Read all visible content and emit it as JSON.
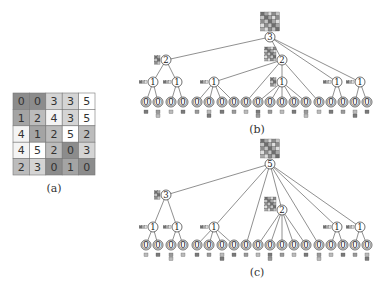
{
  "panel_a": {
    "caption": "(a)",
    "grid": [
      [
        0,
        0,
        3,
        3,
        5
      ],
      [
        1,
        2,
        4,
        3,
        5
      ],
      [
        4,
        1,
        2,
        5,
        2
      ],
      [
        4,
        5,
        2,
        0,
        3
      ],
      [
        2,
        3,
        0,
        1,
        0
      ]
    ],
    "value_colors": {
      "0": "#8c8c8c",
      "1": "#a4a4a4",
      "2": "#bcbcbc",
      "3": "#d4d4d4",
      "4": "#f4f4f4",
      "5": "#ffffff"
    }
  },
  "panel_b": {
    "caption": "(b)",
    "nodes": [
      {
        "id": "r",
        "label": "3",
        "x": 270,
        "y": 37,
        "thumb": "big"
      },
      {
        "id": "L",
        "label": "2",
        "x": 166,
        "y": 60,
        "parent": "r",
        "thumb": "small"
      },
      {
        "id": "R",
        "label": "2",
        "x": 282,
        "y": 60,
        "parent": "r",
        "thumb": "med"
      },
      {
        "id": "L1",
        "label": "1",
        "x": 153,
        "y": 82,
        "parent": "L",
        "thumb": "tiny"
      },
      {
        "id": "L2",
        "label": "1",
        "x": 177,
        "y": 82,
        "parent": "L",
        "thumb": "tiny"
      },
      {
        "id": "R1",
        "label": "1",
        "x": 214,
        "y": 82,
        "parent": "R",
        "thumb": "tiny"
      },
      {
        "id": "R2",
        "label": "1",
        "x": 282,
        "y": 82,
        "parent": "R",
        "thumb": "small"
      },
      {
        "id": "R3",
        "label": "1",
        "x": 337,
        "y": 82,
        "parent": "r",
        "thumb": "tiny"
      },
      {
        "id": "R4",
        "label": "1",
        "x": 360,
        "y": 82,
        "parent": "r",
        "thumb": "tiny"
      },
      {
        "id": "l1",
        "label": "0",
        "x": 146,
        "y": 102,
        "parent": "L1"
      },
      {
        "id": "l2",
        "label": "0",
        "x": 158,
        "y": 102,
        "parent": "L1"
      },
      {
        "id": "l3",
        "label": "0",
        "x": 171,
        "y": 102,
        "parent": "L2"
      },
      {
        "id": "l4",
        "label": "0",
        "x": 183,
        "y": 102,
        "parent": "L2"
      },
      {
        "id": "l5",
        "label": "0",
        "x": 197,
        "y": 102,
        "parent": "R1"
      },
      {
        "id": "l6",
        "label": "0",
        "x": 209,
        "y": 102,
        "parent": "R1"
      },
      {
        "id": "l7",
        "label": "0",
        "x": 222,
        "y": 102,
        "parent": "R1"
      },
      {
        "id": "l8",
        "label": "0",
        "x": 234,
        "y": 102,
        "parent": "R1"
      },
      {
        "id": "l9",
        "label": "0",
        "x": 246,
        "y": 102,
        "parent": "R"
      },
      {
        "id": "l10",
        "label": "0",
        "x": 258,
        "y": 102,
        "parent": "R2"
      },
      {
        "id": "l11",
        "label": "0",
        "x": 270,
        "y": 102,
        "parent": "R2"
      },
      {
        "id": "l12",
        "label": "0",
        "x": 282,
        "y": 102,
        "parent": "R2"
      },
      {
        "id": "l13",
        "label": "0",
        "x": 294,
        "y": 102,
        "parent": "R2"
      },
      {
        "id": "l14",
        "label": "0",
        "x": 306,
        "y": 102,
        "parent": "R2"
      },
      {
        "id": "l15",
        "label": "0",
        "x": 319,
        "y": 102,
        "parent": "R"
      },
      {
        "id": "l16",
        "label": "0",
        "x": 331,
        "y": 102,
        "parent": "R3"
      },
      {
        "id": "l17",
        "label": "0",
        "x": 343,
        "y": 102,
        "parent": "R3"
      },
      {
        "id": "l18",
        "label": "0",
        "x": 355,
        "y": 102,
        "parent": "R4"
      },
      {
        "id": "l19",
        "label": "0",
        "x": 367,
        "y": 102,
        "parent": "R4"
      }
    ],
    "caption_x": 257,
    "caption_y": 133
  },
  "panel_c": {
    "caption": "(c)",
    "nodes": [
      {
        "id": "r",
        "label": "5",
        "x": 270,
        "y": 164,
        "thumb": "big"
      },
      {
        "id": "L",
        "label": "3",
        "x": 166,
        "y": 195,
        "parent": "r",
        "thumb": "small"
      },
      {
        "id": "M",
        "label": "2",
        "x": 282,
        "y": 210,
        "parent": "r",
        "thumb": "med"
      },
      {
        "id": "L1",
        "label": "1",
        "x": 153,
        "y": 227,
        "parent": "L",
        "thumb": "tiny"
      },
      {
        "id": "L2",
        "label": "1",
        "x": 177,
        "y": 227,
        "parent": "L",
        "thumb": "tiny"
      },
      {
        "id": "R1",
        "label": "1",
        "x": 214,
        "y": 227,
        "parent": "r",
        "thumb": "tiny"
      },
      {
        "id": "R3",
        "label": "1",
        "x": 337,
        "y": 227,
        "parent": "r",
        "thumb": "tiny"
      },
      {
        "id": "R4",
        "label": "1",
        "x": 360,
        "y": 227,
        "parent": "r",
        "thumb": "tiny"
      },
      {
        "id": "l1",
        "label": "0",
        "x": 146,
        "y": 245,
        "parent": "L1"
      },
      {
        "id": "l2",
        "label": "0",
        "x": 158,
        "y": 245,
        "parent": "L1"
      },
      {
        "id": "l3",
        "label": "0",
        "x": 171,
        "y": 245,
        "parent": "L2"
      },
      {
        "id": "l4",
        "label": "0",
        "x": 183,
        "y": 245,
        "parent": "L2"
      },
      {
        "id": "l5",
        "label": "0",
        "x": 197,
        "y": 245,
        "parent": "R1"
      },
      {
        "id": "l6",
        "label": "0",
        "x": 209,
        "y": 245,
        "parent": "R1"
      },
      {
        "id": "l7",
        "label": "0",
        "x": 222,
        "y": 245,
        "parent": "R1"
      },
      {
        "id": "l8",
        "label": "0",
        "x": 234,
        "y": 245,
        "parent": "R1"
      },
      {
        "id": "l9",
        "label": "0",
        "x": 246,
        "y": 245,
        "parent": "r"
      },
      {
        "id": "l10",
        "label": "0",
        "x": 258,
        "y": 245,
        "parent": "M"
      },
      {
        "id": "l11",
        "label": "0",
        "x": 270,
        "y": 245,
        "parent": "M"
      },
      {
        "id": "l12",
        "label": "0",
        "x": 282,
        "y": 245,
        "parent": "M"
      },
      {
        "id": "l13",
        "label": "0",
        "x": 294,
        "y": 245,
        "parent": "M"
      },
      {
        "id": "l14",
        "label": "0",
        "x": 306,
        "y": 245,
        "parent": "M"
      },
      {
        "id": "l15",
        "label": "0",
        "x": 319,
        "y": 245,
        "parent": "r"
      },
      {
        "id": "l16",
        "label": "0",
        "x": 331,
        "y": 245,
        "parent": "R3"
      },
      {
        "id": "l17",
        "label": "0",
        "x": 343,
        "y": 245,
        "parent": "R3"
      },
      {
        "id": "l18",
        "label": "0",
        "x": 355,
        "y": 245,
        "parent": "R4"
      },
      {
        "id": "l19",
        "label": "0",
        "x": 367,
        "y": 245,
        "parent": "R4"
      }
    ],
    "caption_x": 257,
    "caption_y": 276
  }
}
